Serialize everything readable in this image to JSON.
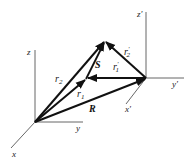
{
  "diagram": {
    "type": "vector-diagram",
    "frames": [
      {
        "name": "unprimed",
        "origin": "O",
        "axes": {
          "x": "x",
          "y": "y",
          "z": "z"
        }
      },
      {
        "name": "primed",
        "origin": "O'",
        "axes": {
          "x": "x'",
          "y": "y'",
          "z": "z'"
        }
      }
    ],
    "vectors": [
      {
        "id": "r1",
        "label": "r",
        "subscript": "1",
        "prime": "",
        "from": "O",
        "to": "P1"
      },
      {
        "id": "r2",
        "label": "r",
        "subscript": "2",
        "prime": "",
        "from": "O",
        "to": "P2"
      },
      {
        "id": "R",
        "label": "R",
        "subscript": "",
        "prime": "",
        "from": "O",
        "to": "O'"
      },
      {
        "id": "S",
        "label": "S",
        "subscript": "",
        "prime": "",
        "from": "P1",
        "to": "P2"
      },
      {
        "id": "r1p",
        "label": "r",
        "subscript": "1",
        "prime": "′",
        "from": "O'",
        "to": "P1"
      },
      {
        "id": "r2p",
        "label": "r",
        "subscript": "2",
        "prime": "′",
        "from": "O'",
        "to": "P2"
      }
    ],
    "colors": {
      "vector": "#111111",
      "axis": "#555555",
      "label": "#222222"
    }
  },
  "labels": {
    "x": "x",
    "y": "y",
    "z": "z",
    "xp": "x′",
    "yp": "y′",
    "zp": "z′",
    "r1_base": "r",
    "r1_sub": "1",
    "r2_base": "r",
    "r2_sub": "2",
    "R": "R",
    "S": "S",
    "r1p_base": "r",
    "r1p_sup": "′",
    "r1p_sub": "1",
    "r2p_base": "r",
    "r2p_sup": "′",
    "r2p_sub": "2"
  }
}
